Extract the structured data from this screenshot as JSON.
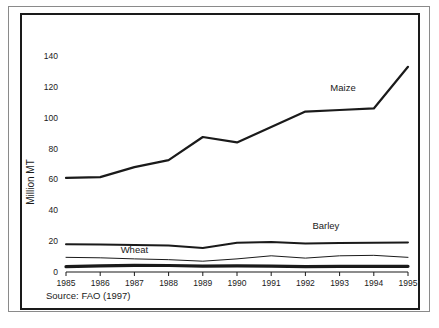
{
  "figure": {
    "source_note": "Source: FAO (1997)",
    "ylabel": "Million MT"
  },
  "chart_data": {
    "type": "line",
    "title": "",
    "subtitle": "",
    "xlabel": "",
    "ylabel": "Million MT",
    "x": [
      1985,
      1986,
      1987,
      1988,
      1989,
      1990,
      1991,
      1992,
      1993,
      1994,
      1995
    ],
    "categories": [
      "1985",
      "1986",
      "1987",
      "1988",
      "1989",
      "1990",
      "1991",
      "1992",
      "1993",
      "1994",
      "1995"
    ],
    "xlim": [
      1985,
      1995
    ],
    "ylim": [
      0,
      148
    ],
    "yticks": [
      0,
      20,
      40,
      60,
      80,
      100,
      120,
      140
    ],
    "ytick_labels": [
      "0",
      "20",
      "40",
      "60",
      "80",
      "100",
      "120",
      "140"
    ],
    "xticks": [
      1985,
      1986,
      1987,
      1988,
      1989,
      1990,
      1991,
      1992,
      1993,
      1994,
      1995
    ],
    "xtick_labels": [
      "1985",
      "1986",
      "1987",
      "1988",
      "1989",
      "1990",
      "1991",
      "1992",
      "1993",
      "1994",
      "1995"
    ],
    "grid": false,
    "legend_position": "inline-annotations",
    "annotations": [
      {
        "text": "Maize",
        "x": 1993.1,
        "y": 117
      },
      {
        "text": "Barley",
        "x": 1992.6,
        "y": 28
      },
      {
        "text": "Wheat",
        "x": 1987.0,
        "y": 12.5
      }
    ],
    "series": [
      {
        "name": "Maize",
        "color": "#1a1a1a",
        "line_width": 2.2,
        "values": [
          61,
          61.5,
          68,
          72.5,
          87.5,
          84,
          94,
          104,
          105,
          106,
          133
        ]
      },
      {
        "name": "Barley",
        "color": "#1a1a1a",
        "line_width": 2.0,
        "values": [
          18,
          17.8,
          17.5,
          17.2,
          15.5,
          19,
          19.5,
          18.5,
          18.8,
          19,
          19.2
        ]
      },
      {
        "name": "Wheat",
        "color": "#555555",
        "line_width": 1.0,
        "values": [
          9.5,
          9.2,
          8.5,
          8.0,
          7.0,
          8.5,
          10.5,
          9.0,
          10.5,
          10.8,
          9.5
        ]
      },
      {
        "name": "Other",
        "color": "#1a1a1a",
        "line_width": 3.2,
        "values": [
          3.5,
          4.0,
          4.3,
          4.2,
          3.8,
          4.0,
          3.8,
          3.5,
          3.6,
          3.6,
          3.7
        ]
      }
    ]
  }
}
